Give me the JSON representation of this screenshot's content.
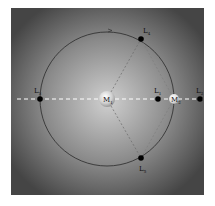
{
  "diagram": {
    "bodies": [
      {
        "id": "M1",
        "label": "M",
        "sub": "1"
      },
      {
        "id": "M2",
        "label": "M",
        "sub": "2"
      }
    ],
    "points": [
      {
        "id": "L1",
        "label": "L",
        "sub": "1"
      },
      {
        "id": "L2",
        "label": "L",
        "sub": "2"
      },
      {
        "id": "L3",
        "label": "L",
        "sub": "3"
      },
      {
        "id": "L4",
        "label": "L",
        "sub": "4"
      },
      {
        "id": "L5",
        "label": "L",
        "sub": "5"
      }
    ],
    "colors": {
      "background_center": "#c8c8c8",
      "background_edge": "#4a4a4a",
      "orbit": "#2a2a2a",
      "axis_dash": "#ffffff",
      "point": "#000000"
    }
  }
}
